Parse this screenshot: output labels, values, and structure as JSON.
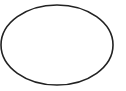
{
  "canvas": {
    "width": 126,
    "height": 91,
    "background": "#ffffff"
  },
  "shapes": [
    {
      "type": "ellipse",
      "cx": 57,
      "cy": 45,
      "rx": 56,
      "ry": 40,
      "stroke": "#222222",
      "stroke_width": 1.6,
      "fill": "none"
    }
  ]
}
